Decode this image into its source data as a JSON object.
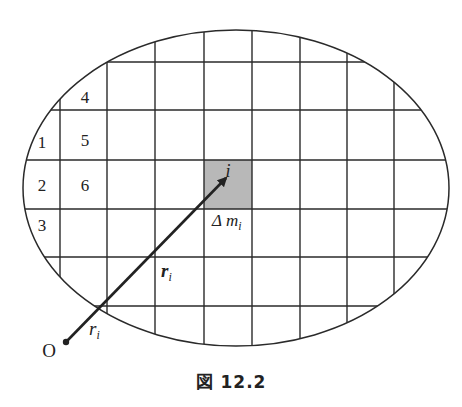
{
  "figure": {
    "caption": "図 12.2",
    "cell_labels": [
      "1",
      "2",
      "3",
      "4",
      "5",
      "6"
    ],
    "shaded_cell_label": "i",
    "mass_element_label": "Δ m",
    "mass_element_subscript": "i",
    "vector_label": "r",
    "vector_subscript": "i",
    "distance_label": "r",
    "distance_subscript": "i",
    "origin_label": "O",
    "colors": {
      "line": "#2a2a2a",
      "shaded_cell": "#b8b8b8",
      "background": "#ffffff"
    }
  }
}
